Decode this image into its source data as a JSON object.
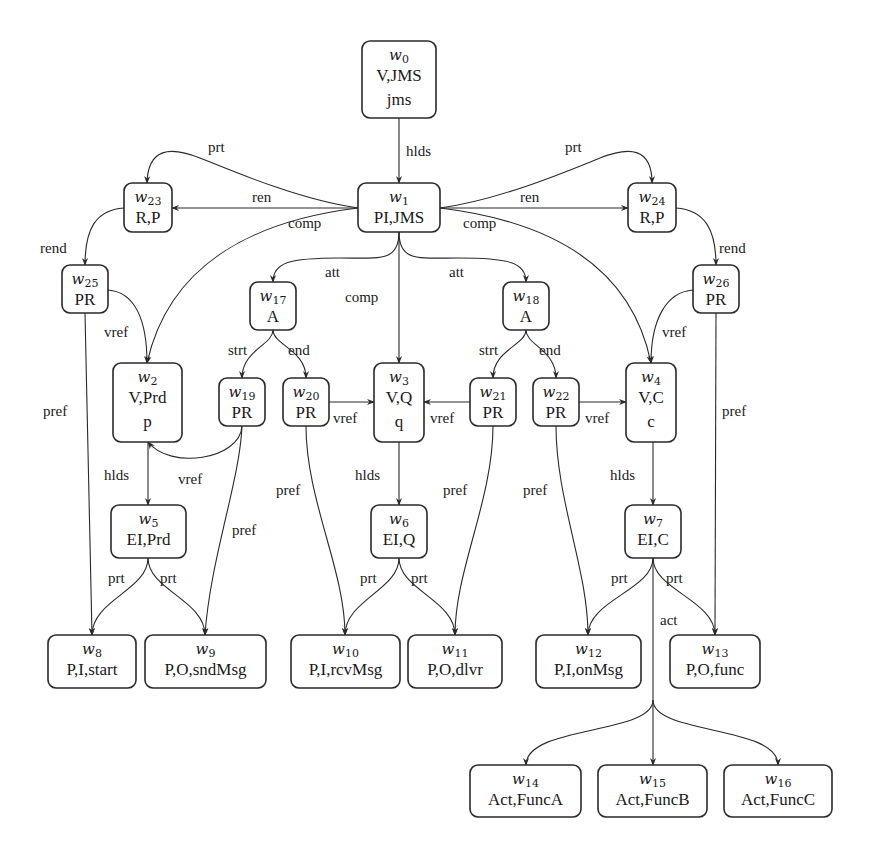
{
  "diagram": {
    "nodes": [
      {
        "id": "w0",
        "name": "w",
        "sub": "0",
        "lines": [
          "V,JMS",
          "jms"
        ],
        "box": [
          362,
          41,
          74,
          77
        ]
      },
      {
        "id": "w1",
        "name": "w",
        "sub": "1",
        "lines": [
          "PI,JMS"
        ],
        "box": [
          358,
          183,
          82,
          49
        ]
      },
      {
        "id": "w2",
        "name": "w",
        "sub": "2",
        "lines": [
          "V,Prd",
          "p"
        ],
        "box": [
          113,
          363,
          69,
          79
        ]
      },
      {
        "id": "w3",
        "name": "w",
        "sub": "3",
        "lines": [
          "V,Q",
          "q"
        ],
        "box": [
          374,
          363,
          50,
          79
        ]
      },
      {
        "id": "w4",
        "name": "w",
        "sub": "4",
        "lines": [
          "V,C",
          "c"
        ],
        "box": [
          626,
          363,
          50,
          79
        ]
      },
      {
        "id": "w5",
        "name": "w",
        "sub": "5",
        "lines": [
          "EI,Prd"
        ],
        "box": [
          111,
          505,
          75,
          53
        ]
      },
      {
        "id": "w6",
        "name": "w",
        "sub": "6",
        "lines": [
          "EI,Q"
        ],
        "box": [
          371,
          505,
          56,
          53
        ]
      },
      {
        "id": "w7",
        "name": "w",
        "sub": "7",
        "lines": [
          "EI,C"
        ],
        "box": [
          625,
          505,
          56,
          53
        ]
      },
      {
        "id": "w8",
        "name": "w",
        "sub": "8",
        "lines": [
          "P,I,start"
        ],
        "box": [
          48,
          635,
          88,
          53
        ]
      },
      {
        "id": "w9",
        "name": "w",
        "sub": "9",
        "lines": [
          "P,O,sndMsg"
        ],
        "box": [
          145,
          635,
          121,
          53
        ]
      },
      {
        "id": "w10",
        "name": "w",
        "sub": "10",
        "lines": [
          "P,I,rcvMsg"
        ],
        "box": [
          291,
          635,
          109,
          53
        ]
      },
      {
        "id": "w11",
        "name": "w",
        "sub": "11",
        "lines": [
          "P,O,dlvr"
        ],
        "box": [
          408,
          635,
          94,
          53
        ]
      },
      {
        "id": "w12",
        "name": "w",
        "sub": "12",
        "lines": [
          "P,I,onMsg"
        ],
        "box": [
          536,
          635,
          105,
          53
        ]
      },
      {
        "id": "w13",
        "name": "w",
        "sub": "13",
        "lines": [
          "P,O,func"
        ],
        "box": [
          670,
          635,
          90,
          53
        ]
      },
      {
        "id": "w14",
        "name": "w",
        "sub": "14",
        "lines": [
          "Act,FuncA"
        ],
        "box": [
          470,
          765,
          111,
          52
        ]
      },
      {
        "id": "w15",
        "name": "w",
        "sub": "15",
        "lines": [
          "Act,FuncB"
        ],
        "box": [
          598,
          765,
          109,
          52
        ]
      },
      {
        "id": "w16",
        "name": "w",
        "sub": "16",
        "lines": [
          "Act,FuncC"
        ],
        "box": [
          724,
          765,
          108,
          52
        ]
      },
      {
        "id": "w17",
        "name": "w",
        "sub": "17",
        "lines": [
          "A"
        ],
        "box": [
          250,
          282,
          46,
          48
        ]
      },
      {
        "id": "w18",
        "name": "w",
        "sub": "18",
        "lines": [
          "A"
        ],
        "box": [
          503,
          282,
          46,
          48
        ]
      },
      {
        "id": "w19",
        "name": "w",
        "sub": "19",
        "lines": [
          "PR"
        ],
        "box": [
          219,
          378,
          46,
          48
        ]
      },
      {
        "id": "w20",
        "name": "w",
        "sub": "20",
        "lines": [
          "PR"
        ],
        "box": [
          283,
          378,
          46,
          48
        ]
      },
      {
        "id": "w21",
        "name": "w",
        "sub": "21",
        "lines": [
          "PR"
        ],
        "box": [
          470,
          378,
          46,
          48
        ]
      },
      {
        "id": "w22",
        "name": "w",
        "sub": "22",
        "lines": [
          "PR"
        ],
        "box": [
          533,
          378,
          46,
          48
        ]
      },
      {
        "id": "w23",
        "name": "w",
        "sub": "23",
        "lines": [
          "R,P"
        ],
        "box": [
          124,
          183,
          48,
          49
        ]
      },
      {
        "id": "w24",
        "name": "w",
        "sub": "24",
        "lines": [
          "R,P"
        ],
        "box": [
          628,
          183,
          48,
          49
        ]
      },
      {
        "id": "w25",
        "name": "w",
        "sub": "25",
        "lines": [
          "PR"
        ],
        "box": [
          62,
          265,
          46,
          48
        ]
      },
      {
        "id": "w26",
        "name": "w",
        "sub": "26",
        "lines": [
          "PR"
        ],
        "box": [
          693,
          265,
          46,
          48
        ]
      }
    ],
    "edges": [
      {
        "from": "w0",
        "to": "w1",
        "label": "hlds",
        "path": "M399 118 L399 183",
        "label_pos": [
          406,
          156
        ]
      },
      {
        "from": "w1",
        "to": "w23",
        "label": "ren",
        "path": "M358 208 L172 208",
        "label_pos": [
          252,
          202
        ]
      },
      {
        "from": "w1",
        "to": "w24",
        "label": "ren",
        "path": "M440 208 L628 208",
        "label_pos": [
          520,
          202
        ]
      },
      {
        "from": "w1",
        "to": "w23",
        "label": "prt",
        "path": "M358 208 C300 200, 230 170, 200 158 C170 146, 148 148, 147 183",
        "label_pos": [
          208,
          152
        ]
      },
      {
        "from": "w1",
        "to": "w24",
        "label": "prt",
        "path": "M440 208 C500 200, 570 170, 600 158 C630 146, 652 148, 652 183",
        "label_pos": [
          565,
          152
        ]
      },
      {
        "from": "w1",
        "to": "w2",
        "label": "comp",
        "path": "M358 208 C260 220, 170 260, 147 363",
        "label_pos": [
          288,
          228
        ]
      },
      {
        "from": "w1",
        "to": "w4",
        "label": "comp",
        "path": "M440 208 C540 220, 630 260, 651 363",
        "label_pos": [
          463,
          228
        ]
      },
      {
        "from": "w1",
        "to": "w3",
        "label": "comp",
        "path": "M399 232 L399 363",
        "label_pos": [
          345,
          302
        ]
      },
      {
        "from": "w1",
        "to": "w17",
        "label": "att",
        "path": "M399 232 C399 262, 380 258, 340 258 C290 258, 273 262, 273 282",
        "label_pos": [
          325,
          277
        ]
      },
      {
        "from": "w1",
        "to": "w18",
        "label": "att",
        "path": "M399 232 C399 262, 418 258, 458 258 C508 258, 526 262, 526 282",
        "label_pos": [
          449,
          277
        ]
      },
      {
        "from": "w23",
        "to": "w25",
        "label": "rend",
        "path": "M124 208 C95 210, 85 230, 85 265",
        "label_pos": [
          40,
          253
        ]
      },
      {
        "from": "w24",
        "to": "w26",
        "label": "rend",
        "path": "M676 208 C705 210, 716 230, 716 265",
        "label_pos": [
          719,
          253
        ]
      },
      {
        "from": "w25",
        "to": "w2",
        "label": "vref",
        "path": "M108 290 C135 292, 147 320, 147 363",
        "label_pos": [
          104,
          337
        ]
      },
      {
        "from": "w26",
        "to": "w4",
        "label": "vref",
        "path": "M693 290 C666 292, 651 320, 651 363",
        "label_pos": [
          662,
          337
        ]
      },
      {
        "from": "w25",
        "to": "w8",
        "label": "pref",
        "path": "M85 313 L92 635",
        "label_pos": [
          43,
          416
        ]
      },
      {
        "from": "w26",
        "to": "w13",
        "label": "pref",
        "path": "M716 313 L715 635",
        "label_pos": [
          722,
          416
        ]
      },
      {
        "from": "w17",
        "to": "w19",
        "label": "strt",
        "path": "M273 330 C273 345, 242 350, 242 378",
        "label_pos": [
          228,
          355
        ]
      },
      {
        "from": "w17",
        "to": "w20",
        "label": "end",
        "path": "M273 330 C273 345, 306 350, 306 378",
        "label_pos": [
          288,
          355
        ]
      },
      {
        "from": "w18",
        "to": "w21",
        "label": "strt",
        "path": "M526 330 C526 345, 493 350, 493 378",
        "label_pos": [
          479,
          355
        ]
      },
      {
        "from": "w18",
        "to": "w22",
        "label": "end",
        "path": "M526 330 C526 345, 556 350, 556 378",
        "label_pos": [
          539,
          355
        ]
      },
      {
        "from": "w20",
        "to": "w3",
        "label": "vref",
        "path": "M329 402 L374 402",
        "label_pos": [
          333,
          423
        ]
      },
      {
        "from": "w21",
        "to": "w3",
        "label": "vref",
        "path": "M470 402 L424 402",
        "label_pos": [
          430,
          423
        ]
      },
      {
        "from": "w22",
        "to": "w4",
        "label": "vref",
        "path": "M579 402 L626 402",
        "label_pos": [
          585,
          423
        ]
      },
      {
        "from": "w19",
        "to": "w2",
        "label": "vref",
        "path": "M242 426 C240 460, 170 470, 148 442",
        "label_pos": [
          178,
          484
        ]
      },
      {
        "from": "w2",
        "to": "w5",
        "label": "hlds",
        "path": "M148 442 L148 505",
        "label_pos": [
          104,
          480
        ]
      },
      {
        "from": "w3",
        "to": "w6",
        "label": "hlds",
        "path": "M399 442 L399 505",
        "label_pos": [
          355,
          480
        ]
      },
      {
        "from": "w4",
        "to": "w7",
        "label": "hlds",
        "path": "M653 442 L653 505",
        "label_pos": [
          610,
          480
        ]
      },
      {
        "from": "w19",
        "to": "w9",
        "label": "pref",
        "path": "M242 426 C240 480, 210 560, 205 635",
        "label_pos": [
          232,
          535
        ]
      },
      {
        "from": "w20",
        "to": "w10",
        "label": "pref",
        "path": "M306 426 C306 500, 345 570, 345 635",
        "label_pos": [
          276,
          495
        ]
      },
      {
        "from": "w21",
        "to": "w11",
        "label": "pref",
        "path": "M493 426 C493 500, 455 570, 455 635",
        "label_pos": [
          443,
          495
        ]
      },
      {
        "from": "w22",
        "to": "w12",
        "label": "pref",
        "path": "M556 426 C556 500, 588 570, 588 635",
        "label_pos": [
          523,
          495
        ]
      },
      {
        "from": "w5",
        "to": "w8",
        "label": "prt",
        "path": "M148 558 C148 590, 92 600, 92 635",
        "label_pos": [
          108,
          583
        ]
      },
      {
        "from": "w5",
        "to": "w9",
        "label": "prt",
        "path": "M148 558 C148 590, 205 600, 205 635",
        "label_pos": [
          160,
          583
        ]
      },
      {
        "from": "w6",
        "to": "w10",
        "label": "prt",
        "path": "M399 558 C399 590, 345 600, 345 635",
        "label_pos": [
          360,
          583
        ]
      },
      {
        "from": "w6",
        "to": "w11",
        "label": "prt",
        "path": "M399 558 C399 590, 455 600, 455 635",
        "label_pos": [
          411,
          583
        ]
      },
      {
        "from": "w7",
        "to": "w12",
        "label": "prt",
        "path": "M653 558 C653 590, 588 600, 588 635",
        "label_pos": [
          611,
          583
        ]
      },
      {
        "from": "w7",
        "to": "w13",
        "label": "prt",
        "path": "M653 558 C653 590, 715 600, 715 635",
        "label_pos": [
          666,
          583
        ]
      },
      {
        "from": "w7",
        "to": "w15",
        "label": "act",
        "path": "M653 558 L653 765",
        "label_pos": [
          660,
          625
        ]
      },
      {
        "from": "w7",
        "to": "w14",
        "label": "",
        "path": "M653 700 C653 735, 526 725, 526 765",
        "label_pos": null
      },
      {
        "from": "w7",
        "to": "w16",
        "label": "",
        "path": "M653 700 C653 735, 778 725, 778 765",
        "label_pos": null
      }
    ]
  }
}
